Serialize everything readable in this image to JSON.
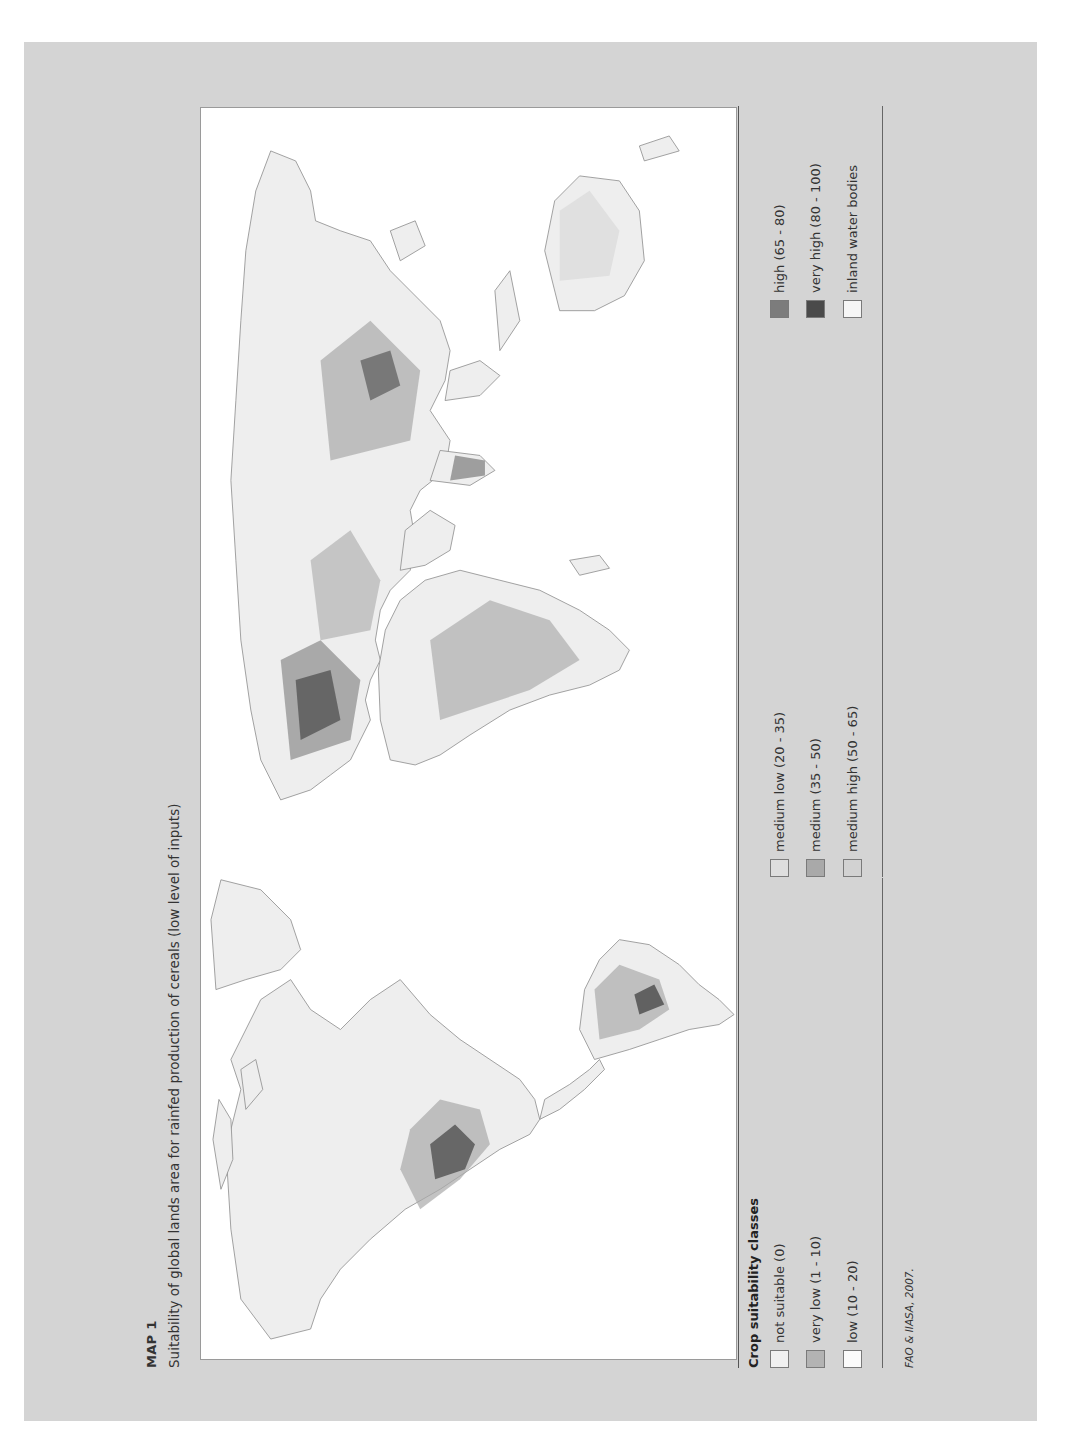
{
  "header": {
    "label": "MAP 1",
    "title": "Suitability of global lands area for rainfed production of cereals (low level of inputs)"
  },
  "legend": {
    "title": "Crop suitability classes",
    "items": [
      {
        "label": "not suitable (0)",
        "color": "#f0f0f0"
      },
      {
        "label": "very low (1 - 10)",
        "color": "#b3b3b3"
      },
      {
        "label": "low (10 - 20)",
        "color": "#fbfbfb"
      },
      {
        "label": "medium low (20 - 35)",
        "color": "#dedede"
      },
      {
        "label": "medium (35 - 50)",
        "color": "#a9a9a9"
      },
      {
        "label": "medium high (50 - 65)",
        "color": "#d2d2d2"
      },
      {
        "label": "high (65 - 80)",
        "color": "#7c7c7c"
      },
      {
        "label": "very high (80 - 100)",
        "color": "#4a4a4a"
      },
      {
        "label": "inland water bodies",
        "color": "#f6f6f6"
      }
    ]
  },
  "source": "FAO & IIASA, 2007.",
  "colors": {
    "panel_background": "#d4d4d4",
    "map_background": "#ffffff",
    "land_base": "#eeeeee",
    "outline": "#8c8c8c"
  }
}
